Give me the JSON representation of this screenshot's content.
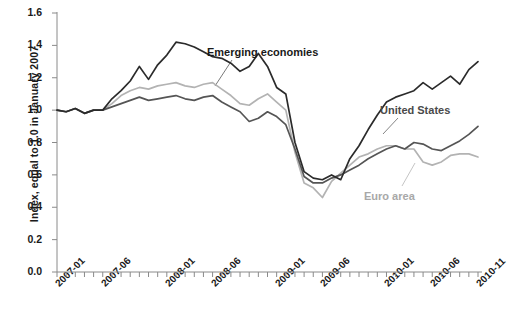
{
  "chart_data": {
    "type": "line",
    "title": "",
    "xlabel": "",
    "ylabel": "Index, equal to 1.0 in January 2007",
    "ylim": [
      0.0,
      1.6
    ],
    "yticks": [
      "0.0",
      "0.2",
      "0.4",
      "0.6",
      "0.8",
      "1.0",
      "1.2",
      "1.4",
      "1.6"
    ],
    "ytick_values": [
      0.0,
      0.2,
      0.4,
      0.6,
      0.8,
      1.0,
      1.2,
      1.4,
      1.6
    ],
    "grid": false,
    "legend_position": "inline-annotations",
    "x": [
      "2007-01",
      "2007-02",
      "2007-03",
      "2007-04",
      "2007-05",
      "2007-06",
      "2007-07",
      "2007-08",
      "2007-09",
      "2007-10",
      "2007-11",
      "2007-12",
      "2008-01",
      "2008-02",
      "2008-03",
      "2008-04",
      "2008-05",
      "2008-06",
      "2008-07",
      "2008-08",
      "2008-09",
      "2008-10",
      "2008-11",
      "2008-12",
      "2009-01",
      "2009-02",
      "2009-03",
      "2009-04",
      "2009-05",
      "2009-06",
      "2009-07",
      "2009-08",
      "2009-09",
      "2009-10",
      "2009-11",
      "2009-12",
      "2010-01",
      "2010-02",
      "2010-03",
      "2010-04",
      "2010-05",
      "2010-06",
      "2010-07",
      "2010-08",
      "2010-09",
      "2010-10",
      "2010-11"
    ],
    "xticks": [
      "2007-01",
      "2007-06",
      "2008-01",
      "2008-06",
      "2009-01",
      "2009-06",
      "2010-01",
      "2010-06",
      "2010-11"
    ],
    "xtick_indices": [
      0,
      5,
      12,
      17,
      24,
      29,
      36,
      41,
      46
    ],
    "series": [
      {
        "name": "Emerging economies",
        "color": "#2b2b2b",
        "values": [
          1.0,
          0.99,
          1.01,
          0.98,
          1.0,
          1.0,
          1.07,
          1.12,
          1.18,
          1.27,
          1.19,
          1.28,
          1.34,
          1.42,
          1.41,
          1.39,
          1.36,
          1.33,
          1.32,
          1.29,
          1.24,
          1.27,
          1.35,
          1.27,
          1.14,
          1.1,
          0.8,
          0.62,
          0.58,
          0.57,
          0.6,
          0.57,
          0.7,
          0.78,
          0.88,
          0.97,
          1.05,
          1.08,
          1.1,
          1.12,
          1.17,
          1.13,
          1.17,
          1.21,
          1.16,
          1.25,
          1.3
        ]
      },
      {
        "name": "United States",
        "color": "#555555",
        "values": [
          1.0,
          0.99,
          1.01,
          0.98,
          1.0,
          1.0,
          1.02,
          1.04,
          1.06,
          1.08,
          1.06,
          1.07,
          1.08,
          1.09,
          1.07,
          1.06,
          1.08,
          1.09,
          1.05,
          1.02,
          0.99,
          0.93,
          0.95,
          0.99,
          0.96,
          0.91,
          0.76,
          0.59,
          0.55,
          0.55,
          0.58,
          0.6,
          0.63,
          0.66,
          0.7,
          0.73,
          0.76,
          0.78,
          0.76,
          0.8,
          0.79,
          0.76,
          0.75,
          0.78,
          0.81,
          0.85,
          0.9
        ]
      },
      {
        "name": "Euro area",
        "color": "#b3b3b3",
        "values": [
          1.0,
          0.99,
          1.01,
          0.98,
          1.0,
          1.0,
          1.04,
          1.09,
          1.12,
          1.14,
          1.13,
          1.15,
          1.16,
          1.17,
          1.15,
          1.14,
          1.16,
          1.17,
          1.13,
          1.09,
          1.04,
          1.03,
          1.07,
          1.1,
          1.05,
          1.0,
          0.74,
          0.55,
          0.52,
          0.46,
          0.56,
          0.61,
          0.66,
          0.71,
          0.73,
          0.76,
          0.78,
          0.78,
          0.76,
          0.76,
          0.68,
          0.66,
          0.68,
          0.72,
          0.73,
          0.73,
          0.71
        ]
      }
    ],
    "annotations": [
      {
        "label": "Emerging economies",
        "series": "Emerging economies"
      },
      {
        "label": "United States",
        "series": "United States"
      },
      {
        "label": "Euro area",
        "series": "Euro area"
      }
    ]
  },
  "axes": {
    "y_axis_label": "Index, equal to 1.0 in January 2007"
  }
}
